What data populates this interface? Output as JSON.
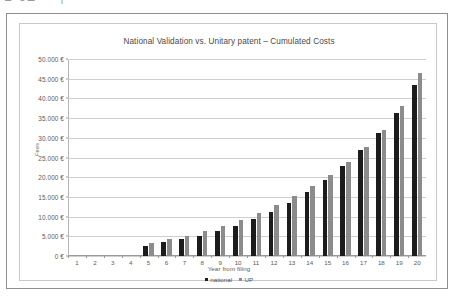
{
  "scan": {
    "top_text_fragment": "⊔ ᴜ⊐⌐⌐┐ ⌐⌐ ⌐⌐ ⌐⌐ ⌐⌐⌐ ⌐⌐ ⌐ ⌐⌐ ⌐⌐"
  },
  "chart_data": {
    "type": "bar",
    "title": "National Validation vs. Unitary patent – Cumulated Costs",
    "xlabel": "Year from filing",
    "ylabel": "Fees",
    "grid": true,
    "legend_position": "bottom",
    "ylim": [
      0,
      50000
    ],
    "ytick_labels": [
      "50.000 €",
      "45.000 €",
      "40.000 €",
      "35.000 €",
      "30.000 €",
      "25.000 €",
      "20.000 €",
      "15.000 €",
      "10.000 €",
      "5.000 €",
      "0 €"
    ],
    "ytick_values": [
      50000,
      45000,
      40000,
      35000,
      30000,
      25000,
      20000,
      15000,
      10000,
      5000,
      0
    ],
    "categories": [
      "1",
      "2",
      "3",
      "4",
      "5",
      "6",
      "7",
      "8",
      "9",
      "10",
      "11",
      "12",
      "13",
      "14",
      "15",
      "16",
      "17",
      "18",
      "19",
      "20"
    ],
    "series": [
      {
        "name": "national",
        "color": "#1c1c1c",
        "values": [
          0,
          0,
          0,
          0,
          2600,
          3500,
          4300,
          5200,
          6400,
          7700,
          9300,
          11200,
          13500,
          16200,
          19400,
          22900,
          26900,
          31300,
          36400,
          43500
        ]
      },
      {
        "name": "UP",
        "color": "#8c8c8c",
        "values": [
          0,
          0,
          0,
          0,
          3200,
          4200,
          5100,
          6300,
          7600,
          9100,
          10900,
          12900,
          15200,
          17700,
          20600,
          23900,
          27700,
          32100,
          38000,
          46500
        ]
      }
    ]
  }
}
